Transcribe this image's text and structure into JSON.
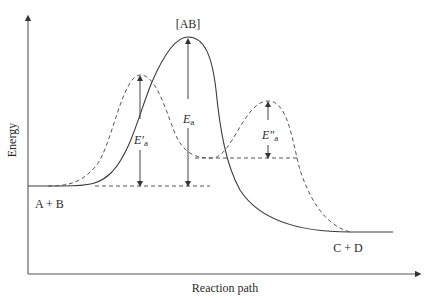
{
  "diagram": {
    "axes": {
      "y_label": "Energy",
      "x_label": "Reaction path"
    },
    "labels": {
      "transition_state": "[AB]",
      "reactants": "A + B",
      "products": "C + D",
      "ea_uncatalysed_main": "E",
      "ea_uncatalysed_sub": "a",
      "ea_first_step_main": "E′",
      "ea_first_step_sub": "a",
      "ea_second_step_main": "E″",
      "ea_second_step_sub": "a"
    },
    "curves": [
      {
        "name": "uncatalysed-path",
        "style": "solid",
        "description": "single peak through [AB]"
      },
      {
        "name": "catalysed-path",
        "style": "dashed",
        "description": "two lower peaks with an intermediate valley"
      }
    ],
    "colors": {
      "line": "#3a3a3a",
      "text": "#2a2a2a",
      "background": "#ffffff"
    }
  }
}
